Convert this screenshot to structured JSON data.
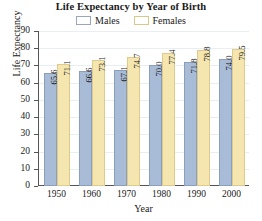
{
  "chart_data": {
    "type": "bar",
    "title": "Life Expectancy by Year of Birth",
    "xlabel": "Year",
    "ylabel": "Life Expectancy",
    "categories": [
      "1950",
      "1960",
      "1970",
      "1980",
      "1990",
      "2000"
    ],
    "series": [
      {
        "name": "Males",
        "color": "#a8bcd8",
        "values": [
          65.6,
          66.6,
          67.1,
          70.0,
          71.8,
          74.0
        ],
        "labels": [
          "65.6",
          "66.6",
          "67.1",
          "70.0",
          "71.8",
          "74.0"
        ]
      },
      {
        "name": "Females",
        "color": "#f5e6b0",
        "values": [
          71.1,
          73.1,
          74.7,
          77.4,
          78.8,
          79.5
        ],
        "labels": [
          "71.1",
          "73.1",
          "74.7",
          "77.4",
          "78.8",
          "79.5"
        ]
      }
    ],
    "ylim": [
      0,
      90
    ],
    "ytick_step": 10,
    "yticks": [
      "90",
      "80",
      "70",
      "60",
      "50",
      "40",
      "30",
      "20",
      "10",
      "0"
    ],
    "grid": true,
    "legend_position": "top-center"
  },
  "legend": {
    "males_label": "Males",
    "females_label": "Females"
  }
}
